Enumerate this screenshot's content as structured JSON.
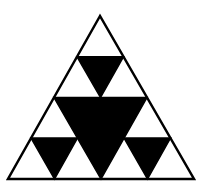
{
  "colors": {
    "background": "#ffffff",
    "fill": "#000000",
    "stroke": "#000000"
  },
  "outer_triangle": {
    "points": "100,16 8,179 194,179"
  },
  "black_triangles": [
    {
      "name": "center",
      "points": "54,97.5 147,97.5 101,179"
    },
    {
      "name": "top",
      "points": "77,56.75 123.5,56.75 100.5,97.5"
    },
    {
      "name": "bottom-left",
      "points": "31,138 77.5,138 54.5,179"
    },
    {
      "name": "bottom-right",
      "points": "124,138 170.5,138 147.5,179"
    }
  ],
  "inner_lines": [
    {
      "name": "top-row-divider",
      "points": "77,56.75 123.5,56.75"
    },
    {
      "name": "lower-left-divider",
      "points": "31,138 77.5,138"
    },
    {
      "name": "lower-right-divider",
      "points": "124,138 170.5,138"
    }
  ]
}
